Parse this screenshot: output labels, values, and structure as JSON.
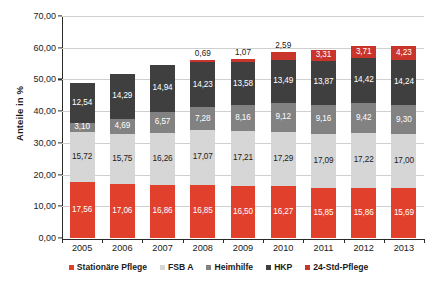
{
  "chart_data": {
    "type": "bar",
    "stacked": true,
    "title": "",
    "xlabel": "",
    "ylabel": "Anteile in %",
    "ylim": [
      0,
      70
    ],
    "ytick_step": 10,
    "ytick_labels": [
      "0,00",
      "10,00",
      "20,00",
      "30,00",
      "40,00",
      "50,00",
      "60,00",
      "70,00"
    ],
    "ytick_values": [
      0,
      10,
      20,
      30,
      40,
      50,
      60,
      70
    ],
    "grid": true,
    "legend_position": "bottom",
    "categories": [
      "2005",
      "2006",
      "2007",
      "2008",
      "2009",
      "2010",
      "2011",
      "2012",
      "2013"
    ],
    "series": [
      {
        "name": "Stationäre Pflege",
        "color": "#e0402c",
        "label_color": "light",
        "values": [
          17.56,
          17.06,
          16.86,
          16.85,
          16.5,
          16.27,
          15.85,
          15.86,
          15.69
        ],
        "labels": [
          "17,56",
          "17,06",
          "16,86",
          "16,85",
          "16,50",
          "16,27",
          "15,85",
          "15,86",
          "15,69"
        ]
      },
      {
        "name": "FSB A",
        "color": "#d6d6d6",
        "label_color": "dark",
        "values": [
          15.72,
          15.75,
          16.26,
          17.07,
          17.21,
          17.29,
          17.09,
          17.22,
          17.0
        ],
        "labels": [
          "15,72",
          "15,75",
          "16,26",
          "17,07",
          "17,21",
          "17,29",
          "17,09",
          "17,22",
          "17,00"
        ]
      },
      {
        "name": "Heimhilfe",
        "color": "#828282",
        "label_color": "light",
        "values": [
          3.1,
          4.69,
          6.57,
          7.28,
          8.16,
          9.12,
          9.16,
          9.42,
          9.3
        ],
        "labels": [
          "3,10",
          "4,69",
          "6,57",
          "7,28",
          "8,16",
          "9,12",
          "9,16",
          "9,42",
          "9,30"
        ]
      },
      {
        "name": "HKP",
        "color": "#3f3f3f",
        "label_color": "light",
        "values": [
          12.54,
          14.29,
          14.94,
          14.23,
          13.58,
          13.49,
          13.87,
          14.42,
          14.24
        ],
        "labels": [
          "12,54",
          "14,29",
          "14,94",
          "14,23",
          "13,58",
          "13,49",
          "13,87",
          "14,42",
          "14,24"
        ]
      },
      {
        "name": "24-Std-Pflege",
        "color": "#c9352a",
        "label_color": "light",
        "values": [
          0,
          0,
          0,
          0.69,
          1.07,
          2.59,
          3.31,
          3.71,
          4.23
        ],
        "labels": [
          "",
          "",
          "",
          "0,69",
          "1,07",
          "2,59",
          "3,31",
          "3,71",
          "4,23"
        ]
      }
    ],
    "totals": [
      48.92,
      51.79,
      54.63,
      56.12,
      56.52,
      58.76,
      59.28,
      60.63,
      60.46
    ]
  },
  "legend": {
    "items": [
      {
        "label": "Stationäre Pflege",
        "color": "#e0402c"
      },
      {
        "label": "FSB A",
        "color": "#d6d6d6"
      },
      {
        "label": "Heimhilfe",
        "color": "#828282"
      },
      {
        "label": "HKP",
        "color": "#3f3f3f"
      },
      {
        "label": "24-Std-Pflege",
        "color": "#c9352a"
      }
    ]
  }
}
